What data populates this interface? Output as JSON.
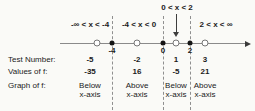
{
  "diagram": {
    "intervals": [
      {
        "label": "-∞ < x < -4"
      },
      {
        "label": "-4 < x < 0"
      },
      {
        "label": "0 < x < 2"
      },
      {
        "label": "2 < x < ∞"
      }
    ],
    "axis": {
      "breakpoints": [
        "-4",
        "0",
        "2"
      ],
      "test_points": [
        "-5",
        "-2",
        "1",
        "3"
      ]
    },
    "table": {
      "rows": [
        {
          "label": "Test Number:",
          "values": [
            "-5",
            "-2",
            "1",
            "3"
          ]
        },
        {
          "label": "Values of f:",
          "values": [
            "-35",
            "16",
            "-5",
            "21"
          ]
        },
        {
          "label": "Graph of f:",
          "values": [
            {
              "line1": "Below",
              "line2": "x-axis"
            },
            {
              "line1": "Above",
              "line2": "x-axis"
            },
            {
              "line1": "Below",
              "line2": "x-axis"
            },
            {
              "line1": "Above",
              "line2": "x-axis"
            }
          ]
        }
      ]
    },
    "colors": {
      "background": "#fafaf7",
      "text": "#1b1b1b",
      "axis_line": "#8a8a8a",
      "dashed_line": "#8f8f8f"
    }
  }
}
